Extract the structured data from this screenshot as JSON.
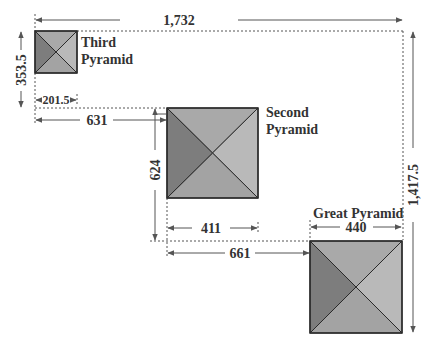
{
  "colors": {
    "face_dark": "#7d7d7d",
    "face_top": "#a9a9a9",
    "face_right": "#b9b9b9",
    "face_bottom": "#a3a3a3",
    "outline": "#2a2a2a",
    "dim_line": "#555555",
    "text": "#333333"
  },
  "pyramids": [
    {
      "id": "third",
      "name_line1": "Third",
      "name_line2": "Pyramid",
      "base": "201.5"
    },
    {
      "id": "second",
      "name_line1": "Second",
      "name_line2": "Pyramid",
      "base": "411"
    },
    {
      "id": "great",
      "name_line1": "Great Pyramid",
      "name_line2": "",
      "base": "440"
    }
  ],
  "dimensions": {
    "total_width": "1,732",
    "total_height": "1,417.5",
    "third_to_second_vertical": "353.5",
    "third_to_second_horizontal": "631",
    "second_to_great_vertical": "624",
    "second_to_great_horizontal": "661",
    "third_base": "201.5",
    "second_base": "411",
    "great_base": "440"
  }
}
